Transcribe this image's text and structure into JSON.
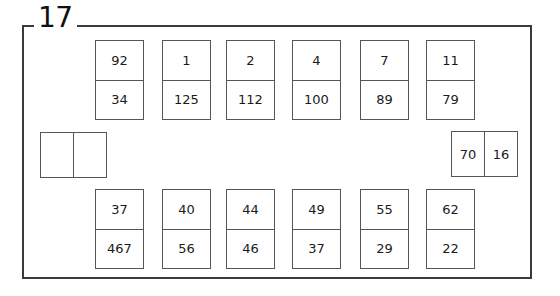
{
  "panel": {
    "title": "17"
  },
  "top_row": [
    {
      "top": "92",
      "bottom": "34"
    },
    {
      "top": "1",
      "bottom": "125"
    },
    {
      "top": "2",
      "bottom": "112"
    },
    {
      "top": "4",
      "bottom": "100"
    },
    {
      "top": "7",
      "bottom": "89"
    },
    {
      "top": "11",
      "bottom": "79"
    }
  ],
  "bottom_row": [
    {
      "top": "37",
      "bottom": "467"
    },
    {
      "top": "40",
      "bottom": "56"
    },
    {
      "top": "44",
      "bottom": "46"
    },
    {
      "top": "49",
      "bottom": "37"
    },
    {
      "top": "55",
      "bottom": "29"
    },
    {
      "top": "62",
      "bottom": "22"
    }
  ],
  "left_relay": {
    "left": "",
    "right": ""
  },
  "right_relay": {
    "left": "70",
    "right": "16"
  }
}
